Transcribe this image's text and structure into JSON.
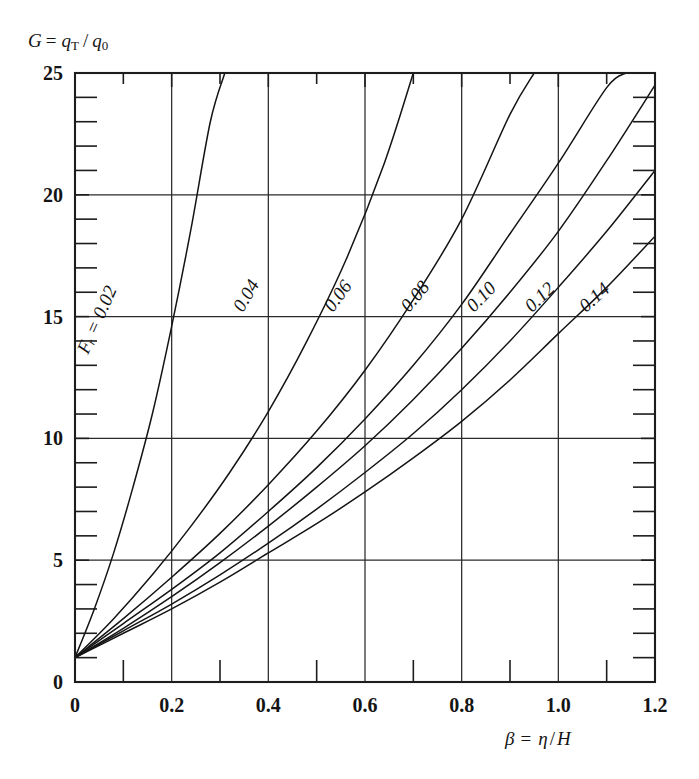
{
  "chart_data": {
    "type": "line",
    "title": "",
    "xlabel": "β = η / H",
    "ylabel": "G = qᴛ / q₀",
    "xlim": [
      0,
      1.2
    ],
    "ylim": [
      0,
      25
    ],
    "grid": true,
    "grid_x": [
      0,
      0.2,
      0.4,
      0.6,
      0.8,
      1.0,
      1.2
    ],
    "grid_y": [
      0,
      5,
      10,
      15,
      20,
      25
    ],
    "xticks_major": [
      "0",
      "0.2",
      "0.4",
      "0.6",
      "0.8",
      "1.0",
      "1.2"
    ],
    "xticks_major_values": [
      0,
      0.2,
      0.4,
      0.6,
      0.8,
      1.0,
      1.2
    ],
    "xticks_minor_values": [
      0.1,
      0.3,
      0.5,
      0.7,
      0.9,
      1.1
    ],
    "yticks_major": [
      "0",
      "5",
      "10",
      "15",
      "20",
      "25"
    ],
    "yticks_major_values": [
      0,
      5,
      10,
      15,
      20,
      25
    ],
    "yticks_minor_values": [
      1,
      2,
      3,
      4,
      6,
      7,
      8,
      9,
      11,
      12,
      13,
      14,
      16,
      17,
      18,
      19,
      21,
      22,
      23,
      24
    ],
    "legend_position": "inline-curve-labels",
    "series_label_prefix": "Fᵣ =",
    "series": [
      {
        "name": "0.02",
        "label": "Fᵣ = 0.02",
        "x": [
          0.0,
          0.04,
          0.08,
          0.12,
          0.16,
          0.2,
          0.24,
          0.28,
          0.31
        ],
        "values": [
          1.0,
          3.0,
          5.3,
          8.0,
          11.0,
          14.6,
          18.6,
          23.0,
          25.0
        ]
      },
      {
        "name": "0.04",
        "label": "0.04",
        "x": [
          0.0,
          0.08,
          0.16,
          0.24,
          0.32,
          0.4,
          0.48,
          0.56,
          0.64,
          0.7
        ],
        "values": [
          1.0,
          2.6,
          4.4,
          6.4,
          8.6,
          11.1,
          14.0,
          17.3,
          21.3,
          25.0
        ]
      },
      {
        "name": "0.06",
        "label": "0.06",
        "x": [
          0.0,
          0.1,
          0.2,
          0.3,
          0.4,
          0.5,
          0.6,
          0.7,
          0.8,
          0.9,
          0.95
        ],
        "values": [
          1.0,
          2.6,
          4.3,
          6.1,
          8.1,
          10.3,
          12.8,
          15.7,
          19.0,
          23.3,
          25.0
        ]
      },
      {
        "name": "0.08",
        "label": "0.08",
        "x": [
          0.0,
          0.1,
          0.2,
          0.3,
          0.4,
          0.5,
          0.6,
          0.7,
          0.8,
          0.9,
          1.0,
          1.1,
          1.14
        ],
        "values": [
          1.0,
          2.4,
          3.8,
          5.3,
          7.0,
          8.8,
          10.8,
          13.0,
          15.5,
          18.4,
          21.3,
          24.4,
          25.0
        ]
      },
      {
        "name": "0.10",
        "label": "0.10",
        "x": [
          0.0,
          0.1,
          0.2,
          0.3,
          0.4,
          0.5,
          0.6,
          0.7,
          0.8,
          0.9,
          1.0,
          1.1,
          1.2
        ],
        "values": [
          1.0,
          2.2,
          3.5,
          4.9,
          6.4,
          8.0,
          9.7,
          11.6,
          13.7,
          16.0,
          18.5,
          21.4,
          24.5
        ]
      },
      {
        "name": "0.12",
        "label": "0.12",
        "x": [
          0.0,
          0.1,
          0.2,
          0.3,
          0.4,
          0.5,
          0.6,
          0.7,
          0.8,
          0.9,
          1.0,
          1.1,
          1.2
        ],
        "values": [
          1.0,
          2.1,
          3.2,
          4.4,
          5.7,
          7.1,
          8.6,
          10.2,
          12.0,
          14.0,
          16.2,
          18.5,
          21.0
        ]
      },
      {
        "name": "0.14",
        "label": "0.14",
        "x": [
          0.0,
          0.1,
          0.2,
          0.3,
          0.4,
          0.5,
          0.6,
          0.7,
          0.8,
          0.9,
          1.0,
          1.1,
          1.2
        ],
        "values": [
          1.0,
          2.0,
          3.0,
          4.1,
          5.3,
          6.5,
          7.8,
          9.2,
          10.7,
          12.4,
          14.3,
          16.2,
          18.3
        ]
      }
    ],
    "curve_labels": [
      {
        "text": "Fᵣ = 0.02",
        "x": 88,
        "y": 355,
        "rotation": -66
      },
      {
        "text": "0.04",
        "x": 243,
        "y": 313,
        "rotation": -60
      },
      {
        "text": "0.06",
        "x": 333,
        "y": 313,
        "rotation": -54
      },
      {
        "text": "0.08",
        "x": 409,
        "y": 313,
        "rotation": -50
      },
      {
        "text": "0.10",
        "x": 474,
        "y": 313,
        "rotation": -46
      },
      {
        "text": "0.12",
        "x": 532,
        "y": 313,
        "rotation": -44
      },
      {
        "text": "0.14",
        "x": 586,
        "y": 313,
        "rotation": -42
      }
    ]
  },
  "axes": {
    "y_label_parts": {
      "g": "G",
      "eq": "=",
      "q1": "q",
      "sub1": "T",
      "slash": "/",
      "q2": "q",
      "sub2": "0"
    },
    "x_label_parts": {
      "beta": "β",
      "eq": "=",
      "eta": "η",
      "slash": "/",
      "h": "H"
    }
  },
  "colors": {
    "ink": "#141414",
    "frame": "#1d1d1d",
    "grid": "#2a2a2a",
    "background": "#ffffff"
  }
}
